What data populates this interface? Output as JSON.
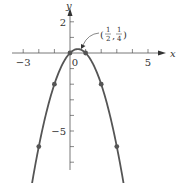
{
  "chart_data": {
    "type": "line",
    "title": "",
    "function": "y = x - x^2",
    "xlabel": "x",
    "ylabel": "y",
    "xlim": [
      -3.5,
      6
    ],
    "ylim": [
      -7.5,
      3.3
    ],
    "x_tick_labels": [
      {
        "value": -3,
        "label": "−3"
      },
      {
        "value": 0,
        "label": "0"
      },
      {
        "value": 5,
        "label": "5"
      }
    ],
    "y_tick_labels": [
      {
        "value": 2,
        "label": "2"
      },
      {
        "value": -5,
        "label": "−5"
      }
    ],
    "x_ticks": [
      -3,
      -2,
      -1,
      0,
      1,
      2,
      3,
      4,
      5
    ],
    "y_ticks": [
      2,
      1,
      0,
      -1,
      -2,
      -3,
      -4,
      -5,
      -6,
      -7
    ],
    "grid": false,
    "points": [
      {
        "x": -2,
        "y": -6
      },
      {
        "x": -1,
        "y": -2
      },
      {
        "x": 0,
        "y": 0
      },
      {
        "x": 1,
        "y": 0
      },
      {
        "x": 2,
        "y": -2
      },
      {
        "x": 3,
        "y": -6
      }
    ],
    "vertex": {
      "x": 0.5,
      "y": 0.25
    },
    "annotation": {
      "text": "(1/2, 1/4)",
      "num1": "1",
      "den1": "2",
      "num2": "1",
      "den2": "4",
      "points_to": [
        0.5,
        0.25
      ]
    },
    "curve_color": "#555555"
  }
}
